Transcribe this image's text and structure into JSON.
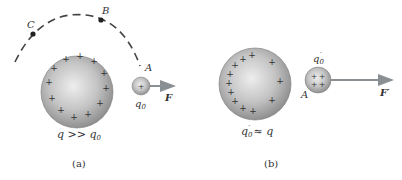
{
  "panel_a": {
    "caption": "(a)",
    "large_charge_label": "q >> q",
    "large_charge_label_parts": {
      "q": "q",
      "op": " >> ",
      "q0": "q",
      "sub": "0"
    },
    "test_charge_label": "q",
    "test_charge_sub": "0",
    "point_A": "A",
    "point_B": "B",
    "point_C": "C",
    "force_label": "F",
    "plus_symbol": "+"
  },
  "panel_b": {
    "caption": "(b)",
    "large_charge_label_parts": {
      "q0": "q",
      "sub": "0",
      "prime": "′",
      "op": " ≈ ",
      "q": "q"
    },
    "test_charge_label": "q",
    "test_charge_sub": "0",
    "test_charge_prime": "′",
    "point_A": "A",
    "force_label": "F′",
    "plus_symbol": "+"
  },
  "colors": {
    "sphere_light": "#e6e6e6",
    "sphere_dark": "#8f8f8f",
    "arrow": "#8a8f94",
    "text": "#333333",
    "dash": "#444444"
  }
}
